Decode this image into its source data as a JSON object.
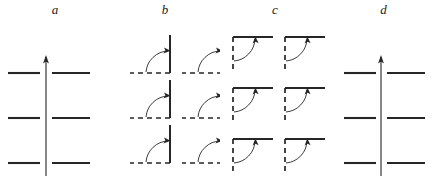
{
  "figure": {
    "width": 437,
    "height": 181,
    "background": "#ffffff",
    "stroke_color": "#262626",
    "panels": [
      {
        "id": "a",
        "label": "a",
        "label_x": 43,
        "x": 0,
        "width": 110,
        "type": "crossed-axis",
        "description": "Vertical arrow line crossing three pairs of horizontal solid segments",
        "arrow": {
          "direction": "up",
          "x": 46,
          "y_top": 57,
          "y_bottom": 176
        },
        "rows_y": [
          73,
          118,
          163
        ],
        "left_segment": {
          "x1": 8,
          "x2": 40
        },
        "right_segment": {
          "x1": 52,
          "x2": 90
        },
        "segment_style": "solid",
        "cells": 3
      },
      {
        "id": "b",
        "label": "b",
        "label_x": 165,
        "x": 110,
        "width": 110,
        "type": "corner-grid",
        "description": "Two by three grid of corner glyphs: solid vertical bar up from corner, dashed horizontal baseline to the left, quarter arc with arrowhead pointing to the vertical bar",
        "columns": 2,
        "rows": 3,
        "corner_x": [
          60,
          112
        ],
        "corner_y": [
          73,
          118,
          163
        ],
        "vertical_style": "solid",
        "vertical_length": 38,
        "horizontal_style": "dashed",
        "horizontal_length": 40,
        "arc_radius": 22,
        "arrow_target": "vertical"
      },
      {
        "id": "c",
        "label": "c",
        "label_x": 277,
        "x": 220,
        "width": 110,
        "type": "corner-grid",
        "description": "Two by three grid of corner glyphs: solid horizontal bar to the right of corner, dashed vertical line down, quarter arc with arrowhead pointing up to the horizontal bar",
        "columns": 2,
        "rows": 3,
        "corner_x": [
          13,
          65
        ],
        "corner_y": [
          37,
          88,
          139
        ],
        "vertical_style": "dashed",
        "vertical_length": 36,
        "horizontal_style": "solid",
        "horizontal_length": 40,
        "arc_radius": 22,
        "arrow_target": "horizontal"
      },
      {
        "id": "d",
        "label": "d",
        "label_x": 398,
        "x": 330,
        "width": 107,
        "type": "crossed-axis",
        "description": "Vertical arrow line crossing three pairs of horizontal solid segments",
        "arrow": {
          "direction": "up",
          "x": 51,
          "y_top": 57,
          "y_bottom": 176
        },
        "rows_y": [
          73,
          118,
          163
        ],
        "left_segment": {
          "x1": 14,
          "x2": 46
        },
        "right_segment": {
          "x1": 57,
          "x2": 95
        },
        "segment_style": "solid",
        "cells": 3
      }
    ]
  }
}
